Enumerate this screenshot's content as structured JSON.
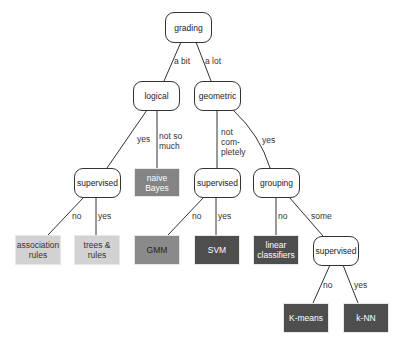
{
  "diagram": {
    "type": "decision-tree",
    "nodes": {
      "grading": "grading",
      "logical": "logical",
      "geometric": "geometric",
      "supervised_left": "supervised",
      "naive_bayes": "naive\nBayes",
      "supervised_mid": "supervised",
      "grouping": "grouping",
      "association_rules": "association\nrules",
      "trees_rules": "trees &\nrules",
      "gmm": "GMM",
      "svm": "SVM",
      "linear_classifiers": "linear\nclassifiers",
      "supervised_right": "supervised",
      "k_means": "K-means",
      "k_nn": "k-NN"
    },
    "edge_labels": {
      "grading_logical": "a bit",
      "grading_geometric": "a lot",
      "logical_supervised": "yes",
      "logical_naive_bayes": "not so\nmuch",
      "geometric_supervised": "not\ncom-\npletely",
      "geometric_grouping": "yes",
      "supervised_left_assoc": "no",
      "supervised_left_trees": "yes",
      "supervised_mid_gmm": "no",
      "supervised_mid_svm": "yes",
      "grouping_linear": "no",
      "grouping_supervised": "some",
      "supervised_right_kmeans": "no",
      "supervised_right_knn": "yes"
    },
    "colors": {
      "light_leaf": "#d2d2d2",
      "medium_leaf": "#848484",
      "dark_leaf": "#4e4e4e",
      "edge": "#333333"
    }
  }
}
